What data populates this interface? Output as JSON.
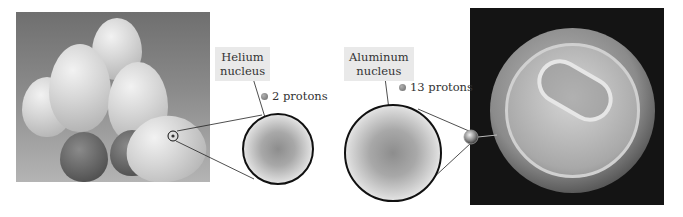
{
  "figure": {
    "left_panel": {
      "image_subject": "bunch of helium balloons",
      "callout": {
        "label_line1": "Helium",
        "label_line2": "nucleus",
        "proton_count_text": "2 protons"
      }
    },
    "right_panel": {
      "image_subject": "top of aluminum soda can",
      "callout": {
        "label_line1": "Aluminum",
        "label_line2": "nucleus",
        "proton_count_text": "13 protons"
      }
    },
    "colors": {
      "label_background": "#e9e9e9",
      "text": "#333333",
      "proton_dot": "#7a7a7a",
      "circle_outline": "#111111"
    }
  }
}
